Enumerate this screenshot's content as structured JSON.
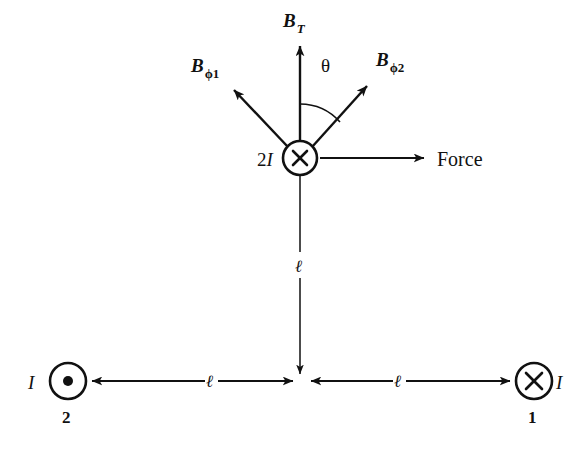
{
  "figure": {
    "background_color": "#ffffff",
    "ink_color": "#111111",
    "labels": {
      "b_total": "B",
      "b_total_sub": "T",
      "b_phi1": "B",
      "b_phi1_sub": "ϕ1",
      "b_phi2": "B",
      "b_phi2_sub": "ϕ2",
      "theta": "θ",
      "force": "Force",
      "center_current": "2",
      "center_current_symbol": "I",
      "left_current_symbol": "I",
      "right_current_symbol": "I",
      "left_conductor_index": "2",
      "right_conductor_index": "1",
      "length_vertical": "ℓ",
      "length_left": "ℓ",
      "length_right": "ℓ"
    },
    "markers": {
      "center_conductor": "cross-into-page",
      "left_conductor": "dot-out-of-page",
      "right_conductor": "cross-into-page"
    },
    "geometry": {
      "center_x": 300,
      "center_y": 158,
      "center_radius": 17,
      "left_x": 68,
      "left_y": 381,
      "right_x": 534,
      "right_y": 381,
      "conductor_radius": 18,
      "baseline_y": 381,
      "theta_degrees": 35
    }
  }
}
